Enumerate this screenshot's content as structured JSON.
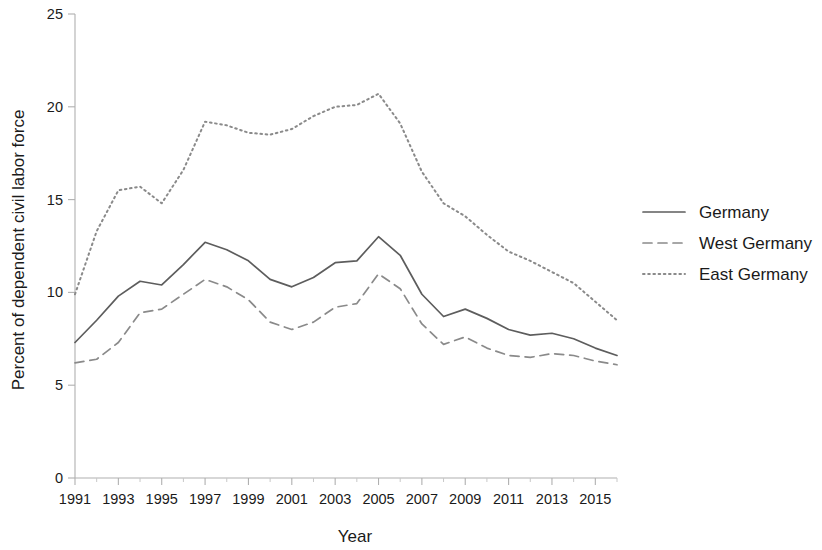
{
  "chart_data": {
    "type": "line",
    "title": "",
    "xlabel": "Year",
    "ylabel": "Percent of dependent civil labor force",
    "xlim": [
      1991,
      2016
    ],
    "ylim": [
      0,
      25
    ],
    "yticks": [
      0,
      5,
      10,
      15,
      20,
      25
    ],
    "ytick_labels": [
      "0",
      "5",
      "10",
      "15",
      "20",
      "25"
    ],
    "xticks": [
      1991,
      1993,
      1995,
      1997,
      1999,
      2001,
      2003,
      2005,
      2007,
      2009,
      2011,
      2013,
      2015
    ],
    "xtick_labels": [
      "1991",
      "1993",
      "1995",
      "1997",
      "1999",
      "2001",
      "2003",
      "2005",
      "2007",
      "2009",
      "2011",
      "2013",
      "2015"
    ],
    "grid": false,
    "legend_position": "right",
    "x": [
      1991,
      1992,
      1993,
      1994,
      1995,
      1996,
      1997,
      1998,
      1999,
      2000,
      2001,
      2002,
      2003,
      2004,
      2005,
      2006,
      2007,
      2008,
      2009,
      2010,
      2011,
      2012,
      2013,
      2014,
      2015,
      2016
    ],
    "series": [
      {
        "name": "Germany",
        "style": "solid",
        "color": "#5d5d5d",
        "values": [
          7.3,
          8.5,
          9.8,
          10.6,
          10.4,
          11.5,
          12.7,
          12.3,
          11.7,
          10.7,
          10.3,
          10.8,
          11.6,
          11.7,
          13.0,
          12.0,
          9.9,
          8.7,
          9.1,
          8.6,
          8.0,
          7.7,
          7.8,
          7.5,
          7.0,
          6.6
        ]
      },
      {
        "name": "West Germany",
        "style": "dashed",
        "color": "#8a8a8a",
        "values": [
          6.2,
          6.4,
          7.3,
          8.9,
          9.1,
          9.9,
          10.7,
          10.3,
          9.6,
          8.4,
          8.0,
          8.4,
          9.2,
          9.4,
          11.0,
          10.2,
          8.3,
          7.2,
          7.6,
          7.0,
          6.6,
          6.5,
          6.7,
          6.6,
          6.3,
          6.1
        ]
      },
      {
        "name": "East Germany",
        "style": "dotted",
        "color": "#8a8a8a",
        "values": [
          9.9,
          13.3,
          15.5,
          15.7,
          14.8,
          16.6,
          19.2,
          19.0,
          18.6,
          18.5,
          18.8,
          19.5,
          20.0,
          20.1,
          20.7,
          19.1,
          16.5,
          14.8,
          14.1,
          13.1,
          12.2,
          11.7,
          11.1,
          10.5,
          9.5,
          8.5
        ]
      }
    ]
  },
  "legend": {
    "entries": [
      {
        "label": "Germany",
        "style": "solid"
      },
      {
        "label": "West Germany",
        "style": "dashed"
      },
      {
        "label": "East Germany",
        "style": "dotted"
      }
    ]
  }
}
